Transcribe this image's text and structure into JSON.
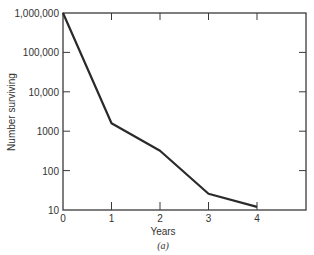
{
  "chart_data": {
    "type": "line",
    "title": "",
    "xlabel": "Years",
    "ylabel": "Number surviving",
    "caption": "(a)",
    "yscale": "log",
    "ylim": [
      10,
      1000000
    ],
    "xlim": [
      0,
      5
    ],
    "x_ticks": [
      "0",
      "1",
      "2",
      "3",
      "4"
    ],
    "y_ticks": [
      "10",
      "100",
      "1000",
      "10,000",
      "100,000",
      "1,000,000"
    ],
    "grid": false,
    "legend": null,
    "series": [
      {
        "name": "Number surviving",
        "x": [
          0,
          1,
          2,
          3,
          4
        ],
        "values": [
          1000000,
          1600,
          320,
          26,
          12
        ],
        "color": "#2a2a2a"
      }
    ]
  },
  "labels": {
    "xlabel": "Years",
    "ylabel": "Number surviving",
    "caption": "(a)"
  }
}
